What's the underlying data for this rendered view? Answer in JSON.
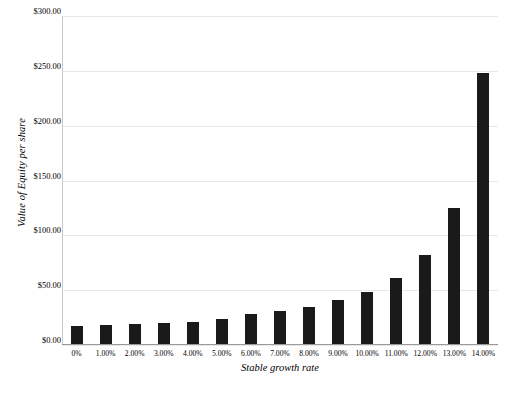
{
  "chart_data": {
    "type": "bar",
    "title": "",
    "xlabel": "Stable growth rate",
    "ylabel": "Value of Equity per share",
    "categories": [
      "0%",
      "1.00%",
      "2.00%",
      "3.00%",
      "4.00%",
      "5.00%",
      "6.00%",
      "7.00%",
      "8.00%",
      "9.00%",
      "10.00%",
      "11.00%",
      "12.00%",
      "13.00%",
      "14.00%"
    ],
    "values": [
      17,
      18,
      19,
      20,
      21,
      24,
      28,
      31,
      35,
      41,
      48,
      61,
      82,
      125,
      248
    ],
    "ylim": [
      0,
      300
    ],
    "ytick_labels": [
      "$0.00",
      "$50.00",
      "$100.00",
      "$150.00",
      "$200.00",
      "$250.00",
      "$300.00"
    ],
    "ytick_values": [
      0,
      50,
      100,
      150,
      200,
      250,
      300
    ],
    "grid": true,
    "legend": "none",
    "bar_color": "#1a1a1a",
    "gridline_color": "#e8e8e8",
    "axis_color": "#9a9a9a"
  },
  "caption": ""
}
